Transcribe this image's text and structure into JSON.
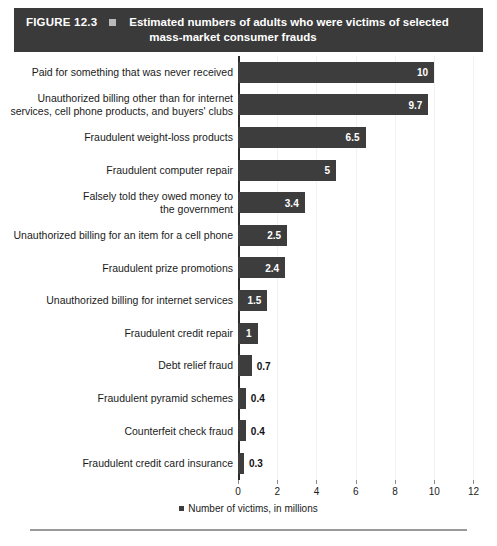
{
  "figure": {
    "number_label": "FIGURE 12.3",
    "marker_icon": "square-marker-icon",
    "title_line1": "Estimated numbers of adults who were victims of selected",
    "title_line2": "mass-market consumer frauds",
    "header_bg": "#3a3a3a",
    "header_text_color": "#ffffff"
  },
  "chart_data": {
    "type": "bar",
    "orientation": "horizontal",
    "title": "Estimated numbers of adults who were victims of selected mass-market consumer frauds",
    "xlabel": "",
    "ylabel": "",
    "xlim": [
      0,
      12
    ],
    "xticks": [
      0,
      2,
      4,
      6,
      8,
      10,
      12
    ],
    "xtick_labels": [
      "0",
      "2",
      "4",
      "6",
      "8",
      "10",
      "12"
    ],
    "grid": true,
    "legend_position": "bottom-center",
    "legend_entries": [
      "Number of victims, in millions"
    ],
    "bar_color": "#3d3d3d",
    "categories": [
      "Paid for something that was never received",
      "Unauthorized billing other than for internet services, cell phone products, and buyers' clubs",
      "Fraudulent weight-loss products",
      "Fraudulent computer repair",
      "Falsely told they owed money to the government",
      "Unauthorized billing for an item for a cell phone",
      "Fraudulent prize promotions",
      "Unauthorized billing for internet services",
      "Fraudulent credit repair",
      "Debt relief fraud",
      "Fraudulent pyramid schemes",
      "Counterfeit check fraud",
      "Fraudulent credit card insurance"
    ],
    "values": [
      10,
      9.7,
      6.5,
      5,
      3.4,
      2.5,
      2.4,
      1.5,
      1,
      0.7,
      0.4,
      0.4,
      0.3
    ],
    "value_labels": [
      "10",
      "9.7",
      "6.5",
      "5",
      "3.4",
      "2.5",
      "2.4",
      "1.5",
      "1",
      "0.7",
      "0.4",
      "0.4",
      "0.3"
    ]
  },
  "rows": [
    {
      "label": "Paid for something that was never received",
      "value": 10,
      "value_label": "10",
      "inside": true
    },
    {
      "label": "Unauthorized billing other than for internet\nservices, cell phone products, and buyers' clubs",
      "value": 9.7,
      "value_label": "9.7",
      "inside": true
    },
    {
      "label": "Fraudulent weight-loss products",
      "value": 6.5,
      "value_label": "6.5",
      "inside": true
    },
    {
      "label": "Fraudulent computer repair",
      "value": 5,
      "value_label": "5",
      "inside": true
    },
    {
      "label": "Falsely told they owed money to\nthe government",
      "value": 3.4,
      "value_label": "3.4",
      "inside": true
    },
    {
      "label": "Unauthorized billing for an item for a cell phone",
      "value": 2.5,
      "value_label": "2.5",
      "inside": true
    },
    {
      "label": "Fraudulent prize promotions",
      "value": 2.4,
      "value_label": "2.4",
      "inside": true
    },
    {
      "label": "Unauthorized billing for internet services",
      "value": 1.5,
      "value_label": "1.5",
      "inside": true
    },
    {
      "label": "Fraudulent credit repair",
      "value": 1,
      "value_label": "1",
      "inside": true
    },
    {
      "label": "Debt relief fraud",
      "value": 0.7,
      "value_label": "0.7",
      "inside": false
    },
    {
      "label": "Fraudulent pyramid schemes",
      "value": 0.4,
      "value_label": "0.4",
      "inside": false
    },
    {
      "label": "Counterfeit check fraud",
      "value": 0.4,
      "value_label": "0.4",
      "inside": false
    },
    {
      "label": "Fraudulent credit card insurance",
      "value": 0.3,
      "value_label": "0.3",
      "inside": false
    }
  ],
  "axis": {
    "ticks": [
      "0",
      "2",
      "4",
      "6",
      "8",
      "10",
      "12"
    ]
  },
  "legend": {
    "swatch_icon": "square-swatch-icon",
    "text": "Number of victims, in millions"
  },
  "source": {
    "text": ""
  }
}
